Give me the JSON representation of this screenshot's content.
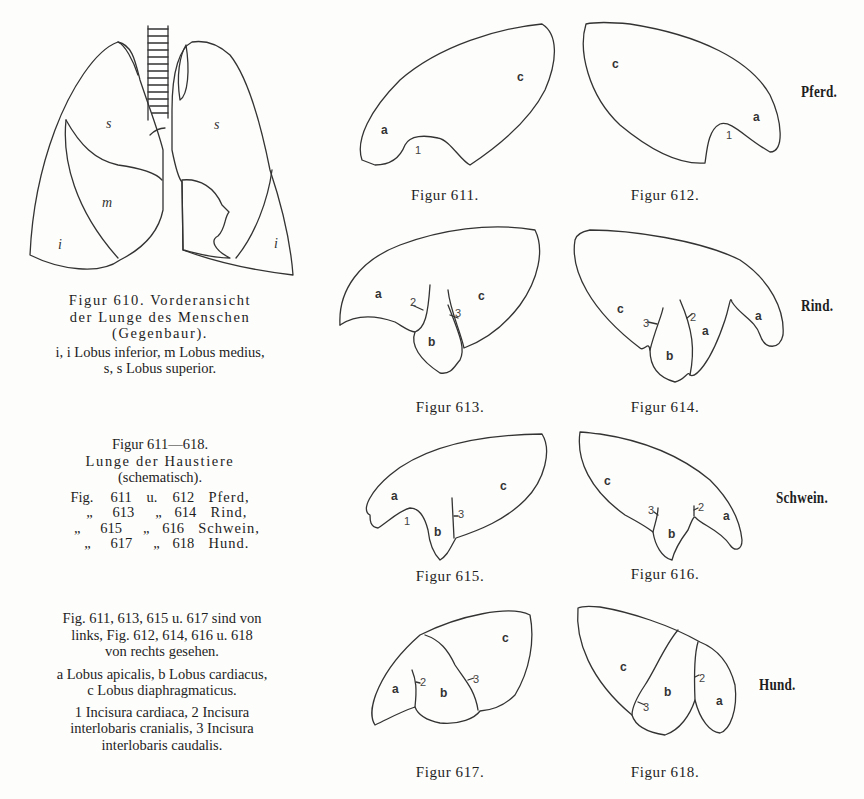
{
  "figure_610": {
    "caption_line1": "Figur 610. Vorderansicht",
    "caption_line2": "der Lunge des Menschen",
    "caption_line3": "(Gegenbaur).",
    "legend_line1": "i, i Lobus inferior, m Lobus medius,",
    "legend_line2": "s, s Lobus superior.",
    "labels": {
      "s_left": "s",
      "s_right": "s",
      "m": "m",
      "i_left": "i",
      "i_right": "i"
    }
  },
  "series_caption": {
    "title": "Figur 611—618.",
    "subtitle": "Lunge der Haustiere",
    "note": "(schematisch).",
    "index": [
      {
        "prefix": "Fig.",
        "a": "611",
        "join": "u.",
        "b": "612",
        "animal": "Pferd,"
      },
      {
        "prefix": "„",
        "a": "613",
        "join": "„",
        "b": "614",
        "animal": "Rind,"
      },
      {
        "prefix": "„",
        "a": "615",
        "join": "„",
        "b": "616",
        "animal": "Schwein,"
      },
      {
        "prefix": "„",
        "a": "617",
        "join": "„",
        "b": "618",
        "animal": "Hund."
      }
    ],
    "view_note_line1": "Fig. 611, 613, 615 u. 617 sind von",
    "view_note_line2": "links, Fig. 612, 614, 616 u. 618",
    "view_note_line3": "von rechts gesehen.",
    "lobes_line1": "a Lobus apicalis, b Lobus cardiacus,",
    "lobes_line2": "c Lobus diaphragmaticus.",
    "incisura_line1": "1 Incisura cardiaca, 2 Incisura",
    "incisura_line2": "interlobaris cranialis, 3 Incisura",
    "incisura_line3": "interlobaris caudalis."
  },
  "figures": {
    "f611": {
      "caption": "Figur 611.",
      "a": "a",
      "c": "c",
      "n1": "1"
    },
    "f612": {
      "caption": "Figur 612.",
      "a": "a",
      "c": "c",
      "n1": "1"
    },
    "f613": {
      "caption": "Figur 613.",
      "a": "a",
      "b": "b",
      "c": "c",
      "n2": "2",
      "n3": "3"
    },
    "f614": {
      "caption": "Figur 614.",
      "a1": "a",
      "a2": "a",
      "b": "b",
      "c": "c",
      "n2": "2",
      "n3": "3"
    },
    "f615": {
      "caption": "Figur 615.",
      "a": "a",
      "b": "b",
      "c": "c",
      "n1": "1",
      "n3": "3"
    },
    "f616": {
      "caption": "Figur 616.",
      "a": "a",
      "b": "b",
      "c": "c",
      "n2": "2",
      "n3": "3"
    },
    "f617": {
      "caption": "Figur 617.",
      "a": "a",
      "b": "b",
      "c": "c",
      "n2": "2",
      "n3": "3"
    },
    "f618": {
      "caption": "Figur 618.",
      "a": "a",
      "b": "b",
      "c": "c",
      "n2": "2",
      "n3": "3"
    }
  },
  "species": {
    "pferd": "Pferd.",
    "rind": "Rind.",
    "schwein": "Schwein.",
    "hund": "Hund."
  }
}
